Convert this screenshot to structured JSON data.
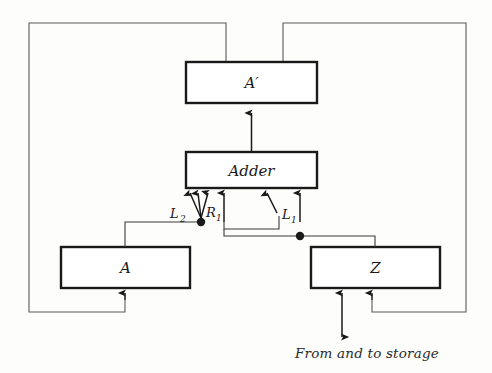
{
  "diagram": {
    "background_color": "#fdfdfc",
    "line_color": "#1a1a1a",
    "thin_line_color": "#4a4a4a",
    "boxes": [
      {
        "id": "a-prime",
        "label": "A′",
        "x": 186,
        "y": 62,
        "w": 131,
        "h": 41
      },
      {
        "id": "adder",
        "label": "Adder",
        "x": 186,
        "y": 152,
        "w": 131,
        "h": 36
      },
      {
        "id": "a",
        "label": "A",
        "x": 61,
        "y": 247,
        "w": 129,
        "h": 41
      },
      {
        "id": "z",
        "label": "Z",
        "x": 311,
        "y": 247,
        "w": 129,
        "h": 41
      }
    ],
    "signal_labels": [
      {
        "id": "l2",
        "base": "L",
        "sub": "2",
        "x": 174,
        "y": 214
      },
      {
        "id": "r1",
        "base": "R",
        "sub": "1",
        "x": 206,
        "y": 214
      },
      {
        "id": "l1",
        "base": "L",
        "sub": "1",
        "x": 276,
        "y": 215
      }
    ],
    "caption": "From and to storage",
    "junctions": [
      {
        "id": "left-junction",
        "x": 201,
        "y": 222
      },
      {
        "id": "right-junction",
        "x": 300,
        "y": 236
      }
    ],
    "frame": {
      "x": 28,
      "y": 22,
      "w": 439,
      "h": 291
    }
  }
}
